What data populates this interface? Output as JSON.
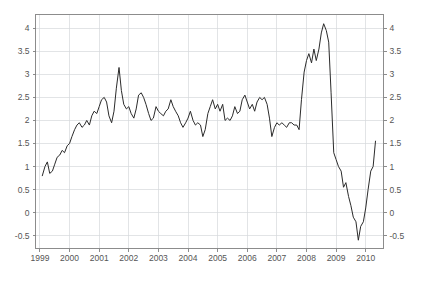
{
  "caption": {
    "text": ""
  },
  "chart_data": {
    "type": "line",
    "title": "",
    "subtitle": "",
    "xlabel": "",
    "ylabel": "",
    "grid": true,
    "legend": false,
    "legend_position": "none",
    "line_color": "#2b2b2b",
    "grid_color": "#d5d8dc",
    "axis_color": "#808080",
    "tick_label_color": "#555555",
    "dual_y_axis": true,
    "xlim": [
      1998.85,
      2010.6
    ],
    "ylim": [
      -0.78,
      4.3
    ],
    "yticks": [
      -0.5,
      0,
      0.5,
      1,
      1.5,
      2,
      2.5,
      3,
      3.5,
      4
    ],
    "ytick_labels_left": [
      "-0.5",
      "0",
      "0.5",
      "1",
      "1.5",
      "2",
      "2.5",
      "3",
      "3.5",
      "4"
    ],
    "ytick_labels_right": [
      "-0.5",
      "0",
      "0.5",
      "1",
      "1.5",
      "2",
      "2.5",
      "3",
      "3.5",
      "4"
    ],
    "xticks": [
      1999,
      2000,
      2001,
      2002,
      2003,
      2004,
      2005,
      2006,
      2007,
      2008,
      2009,
      2010
    ],
    "xtick_labels": [
      "1999",
      "2000",
      "2001",
      "2002",
      "2003",
      "2004",
      "2005",
      "2006",
      "2007",
      "2008",
      "2009",
      "2010"
    ],
    "series": [
      {
        "name": "rate",
        "x": [
          1999.08,
          1999.17,
          1999.25,
          1999.33,
          1999.42,
          1999.5,
          1999.58,
          1999.67,
          1999.75,
          1999.83,
          1999.92,
          2000.0,
          2000.08,
          2000.17,
          2000.25,
          2000.33,
          2000.42,
          2000.5,
          2000.58,
          2000.67,
          2000.75,
          2000.83,
          2000.92,
          2001.0,
          2001.08,
          2001.17,
          2001.25,
          2001.33,
          2001.42,
          2001.5,
          2001.58,
          2001.67,
          2001.75,
          2001.83,
          2001.92,
          2002.0,
          2002.08,
          2002.17,
          2002.25,
          2002.33,
          2002.42,
          2002.5,
          2002.58,
          2002.67,
          2002.75,
          2002.83,
          2002.92,
          2003.0,
          2003.08,
          2003.17,
          2003.25,
          2003.33,
          2003.42,
          2003.5,
          2003.58,
          2003.67,
          2003.75,
          2003.83,
          2003.92,
          2004.0,
          2004.08,
          2004.17,
          2004.25,
          2004.33,
          2004.42,
          2004.5,
          2004.58,
          2004.67,
          2004.75,
          2004.83,
          2004.92,
          2005.0,
          2005.08,
          2005.17,
          2005.25,
          2005.33,
          2005.42,
          2005.5,
          2005.58,
          2005.67,
          2005.75,
          2005.83,
          2005.92,
          2006.0,
          2006.08,
          2006.17,
          2006.25,
          2006.33,
          2006.42,
          2006.5,
          2006.58,
          2006.67,
          2006.75,
          2006.83,
          2006.92,
          2007.0,
          2007.08,
          2007.17,
          2007.25,
          2007.33,
          2007.42,
          2007.5,
          2007.58,
          2007.67,
          2007.75,
          2007.83,
          2007.92,
          2008.0,
          2008.08,
          2008.17,
          2008.25,
          2008.33,
          2008.42,
          2008.5,
          2008.58,
          2008.67,
          2008.75,
          2008.83,
          2008.92,
          2009.0,
          2009.08,
          2009.17,
          2009.25,
          2009.33,
          2009.42,
          2009.5,
          2009.58,
          2009.67,
          2009.75,
          2009.83,
          2009.92,
          2010.0,
          2010.08,
          2010.17,
          2010.25,
          2010.33
        ],
        "values": [
          0.8,
          1.0,
          1.1,
          0.85,
          0.9,
          1.05,
          1.2,
          1.25,
          1.35,
          1.3,
          1.45,
          1.5,
          1.65,
          1.8,
          1.9,
          1.95,
          1.85,
          1.9,
          2.0,
          1.9,
          2.1,
          2.2,
          2.15,
          2.3,
          2.45,
          2.5,
          2.4,
          2.1,
          1.95,
          2.2,
          2.7,
          3.15,
          2.65,
          2.35,
          2.25,
          2.3,
          2.15,
          2.05,
          2.25,
          2.55,
          2.6,
          2.5,
          2.35,
          2.15,
          2.0,
          2.05,
          2.3,
          2.2,
          2.15,
          2.1,
          2.2,
          2.25,
          2.45,
          2.3,
          2.2,
          2.1,
          1.95,
          1.85,
          1.95,
          2.05,
          2.2,
          2.0,
          1.9,
          1.95,
          1.9,
          1.65,
          1.8,
          2.15,
          2.3,
          2.45,
          2.25,
          2.35,
          2.2,
          2.35,
          2.0,
          2.05,
          2.0,
          2.1,
          2.3,
          2.15,
          2.2,
          2.45,
          2.55,
          2.4,
          2.25,
          2.35,
          2.2,
          2.4,
          2.5,
          2.45,
          2.5,
          2.35,
          2.05,
          1.65,
          1.85,
          1.95,
          1.9,
          1.95,
          1.9,
          1.85,
          1.95,
          1.95,
          1.9,
          1.9,
          1.8,
          2.45,
          3.05,
          3.3,
          3.45,
          3.25,
          3.55,
          3.3,
          3.55,
          3.9,
          4.1,
          3.95,
          3.7,
          2.6,
          1.3,
          1.15,
          1.0,
          0.9,
          0.55,
          0.65,
          0.35,
          0.15,
          -0.1,
          -0.2,
          -0.6,
          -0.3,
          -0.2,
          0.1,
          0.5,
          0.9,
          1.0,
          1.55
        ]
      }
    ]
  }
}
